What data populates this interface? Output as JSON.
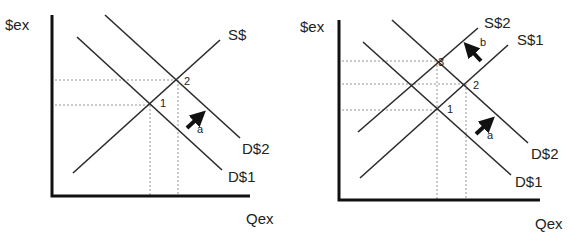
{
  "left_panel": {
    "y_axis_label": "$ex",
    "x_axis_label": "Qex",
    "curves": {
      "supply": "S$",
      "demand1": "D$1",
      "demand2": "D$2"
    },
    "points": [
      "1",
      "2"
    ],
    "arrows": [
      {
        "label": "a",
        "direction": "up-right"
      }
    ]
  },
  "right_panel": {
    "y_axis_label": "$ex",
    "x_axis_label": "Qex",
    "curves": {
      "supply1": "S$1",
      "supply2": "S$2",
      "demand1": "D$1",
      "demand2": "D$2"
    },
    "points": [
      "1",
      "2",
      "3"
    ],
    "arrows": [
      {
        "label": "a",
        "direction": "up-right"
      },
      {
        "label": "b",
        "direction": "up-left"
      }
    ]
  },
  "colors": {
    "line": "#2a2a2a",
    "axis": "#111111",
    "guide": "#888888",
    "background": "#ffffff"
  }
}
